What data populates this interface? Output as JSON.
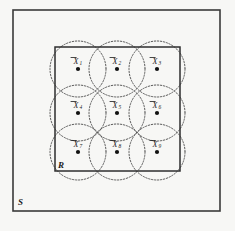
{
  "figure": {
    "background_color": "#f7f7f5",
    "outer_region": {
      "label": "S",
      "label_position": "bottom-left-outside",
      "x": 13,
      "y": 10,
      "width": 207,
      "height": 201,
      "stroke_color": "#3a3a3a",
      "line_style": "solid"
    },
    "inner_region": {
      "label": "R",
      "label_position": "bottom-left-inside",
      "x": 55,
      "y": 47,
      "width": 125,
      "height": 124,
      "stroke_color": "#2e2e2e",
      "line_style": "solid"
    },
    "circles": {
      "radius": 28,
      "stroke_color": "#4a4a4a",
      "line_style": "dotted",
      "count": 9
    },
    "points": [
      {
        "id": "p1",
        "label": "X",
        "subscript": "1",
        "cx": 78,
        "cy": 69,
        "dot_radius": 2.1
      },
      {
        "id": "p2",
        "label": "X",
        "subscript": "2",
        "cx": 117,
        "cy": 69,
        "dot_radius": 2.1
      },
      {
        "id": "p3",
        "label": "X",
        "subscript": "3",
        "cx": 157,
        "cy": 69,
        "dot_radius": 2.1
      },
      {
        "id": "p4",
        "label": "X",
        "subscript": "4",
        "cx": 78,
        "cy": 113,
        "dot_radius": 2.1
      },
      {
        "id": "p5",
        "label": "X",
        "subscript": "5",
        "cx": 117,
        "cy": 113,
        "dot_radius": 2.1
      },
      {
        "id": "p6",
        "label": "X",
        "subscript": "6",
        "cx": 157,
        "cy": 113,
        "dot_radius": 2.1
      },
      {
        "id": "p7",
        "label": "X",
        "subscript": "7",
        "cx": 78,
        "cy": 152,
        "dot_radius": 2.1
      },
      {
        "id": "p8",
        "label": "X",
        "subscript": "8",
        "cx": 117,
        "cy": 152,
        "dot_radius": 2.1
      },
      {
        "id": "p9",
        "label": "X",
        "subscript": "9",
        "cx": 157,
        "cy": 152,
        "dot_radius": 2.1
      }
    ],
    "label_offset": {
      "dx": -4.5,
      "dy": -5.5,
      "sub_dx": 3.6,
      "sub_dy": -3.6
    },
    "overline": {
      "enabled": true,
      "width": 6,
      "offset_y": -11.5
    }
  }
}
